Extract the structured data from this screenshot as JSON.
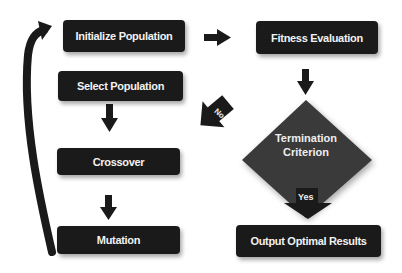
{
  "diagram": {
    "nodes": {
      "initialize": {
        "label": "Initialize Population"
      },
      "fitness": {
        "label": "Fitness Evaluation"
      },
      "select": {
        "label": "Select Population"
      },
      "termination": {
        "label_line1": "Termination",
        "label_line2": "Criterion"
      },
      "crossover": {
        "label": "Crossover"
      },
      "mutation": {
        "label": "Mutation"
      },
      "output": {
        "label": "Output Optimal Results"
      }
    },
    "edges": {
      "no_label": "No",
      "yes_label": "Yes"
    },
    "colors": {
      "box": "#1a1a1a",
      "diamond": "#3a3a3a",
      "text": "#f2f2f2",
      "arrow": "#1a1a1a"
    }
  }
}
